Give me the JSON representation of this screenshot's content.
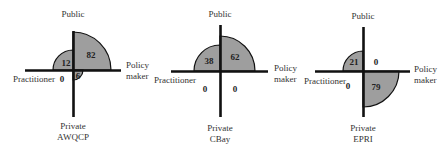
{
  "figure": {
    "axis_labels": {
      "top": "Public",
      "bottom": "Private",
      "left": "Practitioner",
      "right_line1": "Policy",
      "right_line2": "maker"
    },
    "colors": {
      "fill": "#9e9e9e",
      "stroke": "#111111"
    },
    "diagrams": [
      {
        "name": "AWQCP",
        "quadrants": {
          "public_policy": "82",
          "public_practitioner": "12",
          "private_practitioner": "0",
          "private_policy": "6"
        }
      },
      {
        "name": "CBay",
        "quadrants": {
          "public_policy": "62",
          "public_practitioner": "38",
          "private_practitioner": "0",
          "private_policy": "0"
        }
      },
      {
        "name": "EPRI",
        "quadrants": {
          "public_policy": "0",
          "public_practitioner": "21",
          "private_practitioner": "0",
          "private_policy": "79"
        }
      }
    ]
  }
}
